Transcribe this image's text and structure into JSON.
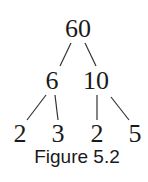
{
  "figure": {
    "caption": "Figure 5.2",
    "type": "factor-tree",
    "line_color": "#333333",
    "text_color": "#1a1a1a"
  },
  "tree": {
    "root": {
      "value": "60",
      "x": 78,
      "y": 16
    },
    "level1": [
      {
        "value": "6",
        "x": 52,
        "y": 68
      },
      {
        "value": "10",
        "x": 96,
        "y": 68
      }
    ],
    "level2": [
      {
        "value": "2",
        "x": 20,
        "y": 121
      },
      {
        "value": "3",
        "x": 58,
        "y": 121
      },
      {
        "value": "2",
        "x": 97,
        "y": 121
      },
      {
        "value": "5",
        "x": 135,
        "y": 121
      }
    ],
    "edges": [
      {
        "from": "60",
        "to": "6",
        "x1": 71,
        "y1": 43,
        "x2": 60,
        "y2": 66
      },
      {
        "from": "60",
        "to": "10",
        "x1": 85,
        "y1": 43,
        "x2": 96,
        "y2": 66
      },
      {
        "from": "6",
        "to": "2",
        "x1": 46,
        "y1": 95,
        "x2": 27,
        "y2": 120
      },
      {
        "from": "6",
        "to": "3",
        "x1": 55,
        "y1": 95,
        "x2": 58,
        "y2": 120
      },
      {
        "from": "10",
        "to": "2",
        "x1": 97,
        "y1": 95,
        "x2": 97,
        "y2": 120
      },
      {
        "from": "10",
        "to": "5",
        "x1": 111,
        "y1": 97,
        "x2": 129,
        "y2": 120
      }
    ]
  }
}
